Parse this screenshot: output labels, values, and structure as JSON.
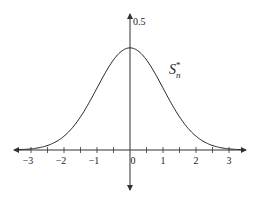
{
  "chart_data": {
    "type": "line",
    "title": "",
    "xlabel": "",
    "ylabel": "",
    "xlim": [
      -3.4,
      3.4
    ],
    "ylim": [
      0,
      0.5
    ],
    "grid": false,
    "x_ticks": [
      -3,
      -2.5,
      -2,
      -1.5,
      -1,
      -0.5,
      0,
      0.5,
      1,
      1.5,
      2,
      2.5,
      3
    ],
    "x_tick_labels": [
      "-3",
      "-2",
      "-1",
      "0",
      "1",
      "2",
      "3"
    ],
    "x_tick_label_values": [
      -3,
      -2,
      -1,
      0,
      1,
      2,
      3
    ],
    "y_tick_labels": [
      "0.5"
    ],
    "y_tick_label_values": [
      0.5
    ],
    "series": [
      {
        "name": "S_n^*",
        "label_main": "S",
        "label_sub": "n",
        "label_sup": "*",
        "description": "standard normal density",
        "x": [
          -3.4,
          -3,
          -2.5,
          -2,
          -1.5,
          -1,
          -0.5,
          0,
          0.5,
          1,
          1.5,
          2,
          2.5,
          3,
          3.4
        ],
        "values": [
          0.0012,
          0.0044,
          0.0175,
          0.054,
          0.1295,
          0.242,
          0.352,
          0.399,
          0.352,
          0.242,
          0.1295,
          0.054,
          0.0175,
          0.0044,
          0.0012
        ]
      }
    ],
    "colors": {
      "line": "#222222",
      "axis": "#333333",
      "background": "#ffffff"
    }
  }
}
